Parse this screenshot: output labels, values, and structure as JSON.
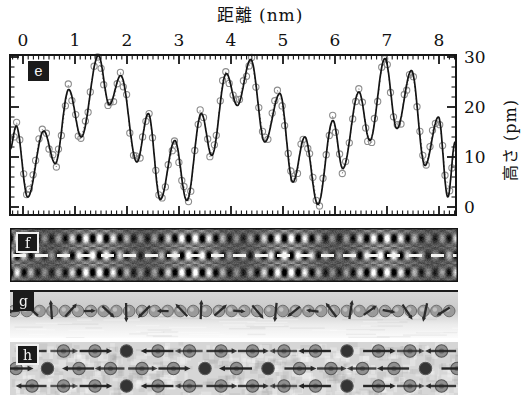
{
  "figure": {
    "top_axis_title": "距離 (nm)",
    "right_axis_title": "高さ (pm)",
    "panel_labels": {
      "e": "e",
      "f": "f",
      "g": "g",
      "h": "h"
    }
  },
  "chart_data": {
    "type": "line",
    "title": "",
    "xlabel": "距離 (nm)",
    "ylabel": "高さ (pm)",
    "xlim": [
      -0.25,
      8.33
    ],
    "ylim": [
      -1.6,
      30.4
    ],
    "x_ticks": [
      0,
      1,
      2,
      3,
      4,
      5,
      6,
      7,
      8
    ],
    "y_ticks": [
      0,
      10,
      20,
      30
    ],
    "x_minor_step": 0.1,
    "y_minor_step": 2,
    "grid": false,
    "series": [
      {
        "name": "fit-curve-solid-line",
        "style": "solid",
        "extrema_nm_pm": [
          [
            -0.25,
            11.5
          ],
          [
            -0.13,
            16.2
          ],
          [
            0.09,
            2.0
          ],
          [
            0.4,
            15.2
          ],
          [
            0.62,
            8.7
          ],
          [
            0.88,
            23.5
          ],
          [
            1.12,
            14.0
          ],
          [
            1.45,
            30.3
          ],
          [
            1.66,
            20.5
          ],
          [
            1.88,
            26.3
          ],
          [
            2.19,
            9.0
          ],
          [
            2.41,
            18.7
          ],
          [
            2.64,
            1.5
          ],
          [
            2.92,
            13.3
          ],
          [
            3.15,
            1.3
          ],
          [
            3.43,
            18.7
          ],
          [
            3.63,
            10.3
          ],
          [
            3.91,
            26.7
          ],
          [
            4.12,
            20.3
          ],
          [
            4.38,
            29.5
          ],
          [
            4.65,
            13.0
          ],
          [
            4.94,
            22.7
          ],
          [
            5.19,
            5.0
          ],
          [
            5.42,
            14.0
          ],
          [
            5.67,
            0.5
          ],
          [
            5.96,
            17.3
          ],
          [
            6.15,
            7.7
          ],
          [
            6.46,
            23.0
          ],
          [
            6.67,
            13.3
          ],
          [
            6.96,
            29.7
          ],
          [
            7.19,
            15.7
          ],
          [
            7.47,
            27.3
          ],
          [
            7.73,
            8.3
          ],
          [
            7.99,
            18.0
          ],
          [
            8.17,
            2.0
          ],
          [
            8.31,
            13.0
          ]
        ]
      },
      {
        "name": "measured-points-open-circles-dotted",
        "style": "circles-dotted",
        "sample_step_nm": 0.062,
        "scatter_pm": 1.3
      }
    ]
  },
  "panel_f": {
    "description_pattern": {
      "spot_spacing_x_px": 13.7,
      "row_spacing_y_px": 17,
      "beat_period_px": 96,
      "beat_phase_px": 85
    },
    "dashed_scan_line": {
      "present": true,
      "color": "#f4f4f2"
    }
  },
  "panel_g": {
    "spin_spiral_period_px": 147,
    "atom_spacing_px": 12.8,
    "arrow_spacing_px": 18.7
  },
  "panel_h": {
    "rows": 3,
    "atom_spacing_px": 31.5,
    "spin_spiral_period_px": 147,
    "adjacent_rows_antiparallel": true
  },
  "colors": {
    "fit_line": "#141414",
    "circle_stroke": "#8d8d8d",
    "dotted_line": "#8a8a8a",
    "frame": "#161616",
    "label_box": "#1b1b1b",
    "label_text": "#f5f5f5",
    "arrow": "#2b2b2b",
    "atom_gray": "#979797"
  }
}
